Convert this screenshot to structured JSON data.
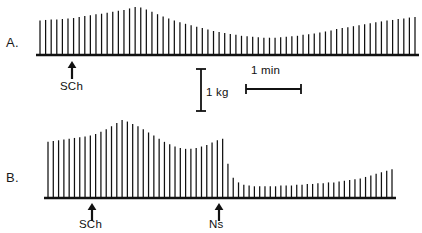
{
  "figure": {
    "background_color": "#ffffff",
    "ink_color": "#111111",
    "width": 422,
    "height": 233
  },
  "panels": [
    {
      "id": "A",
      "label": "A.",
      "label_x": 6,
      "label_y": 35,
      "baseline_y": 55,
      "trace_x_start": 40,
      "trace_x_end": 415,
      "spike_count": 68,
      "annotations": [
        {
          "name": "sch",
          "label": "SCh",
          "arrow_x": 72,
          "label_x": 60,
          "label_y": 84
        }
      ]
    },
    {
      "id": "B",
      "label": "B.",
      "label_x": 6,
      "label_y": 170,
      "baseline_y": 198,
      "trace_x_start": 48,
      "trace_x_end": 392,
      "spike_count": 66,
      "annotations": [
        {
          "name": "sch",
          "label": "SCh",
          "arrow_x": 92,
          "label_x": 80,
          "label_y": 218
        },
        {
          "name": "ns",
          "label": "Ns",
          "arrow_x": 219,
          "label_x": 210,
          "label_y": 218
        }
      ]
    }
  ],
  "calibration": {
    "force": {
      "label": "1 kg",
      "orientation": "vertical",
      "x": 200,
      "y_top": 68,
      "y_bottom": 110,
      "cap_half_width": 5,
      "label_x": 207,
      "label_y": 94
    },
    "time": {
      "label": "1 min",
      "orientation": "horizontal",
      "y": 88,
      "x_left": 246,
      "x_right": 301,
      "cap_half_height": 5,
      "label_x": 253,
      "label_y": 73
    }
  },
  "chart_data": {
    "type": "line",
    "title": "",
    "subtitle": "",
    "xlabel": "",
    "ylabel": "",
    "units": {
      "y": "kg",
      "x": "min"
    },
    "scale_bars": {
      "y": 1,
      "y_unit": "kg",
      "x": 1,
      "x_unit": "min"
    },
    "series": [
      {
        "name": "A",
        "panel": "A",
        "event_markers": [
          {
            "label": "SCh",
            "index": 6
          }
        ],
        "envelope_note": "Baseline twitch height, small augmentation after SCh, peak then progressive depression to a trough near mid-record, followed by slow recovery toward and slightly above control by the end of the trace.",
        "values": [
          0.72,
          0.73,
          0.74,
          0.74,
          0.75,
          0.76,
          0.77,
          0.79,
          0.81,
          0.83,
          0.85,
          0.86,
          0.88,
          0.9,
          0.92,
          0.94,
          0.97,
          1.0,
          0.99,
          0.95,
          0.9,
          0.85,
          0.8,
          0.76,
          0.72,
          0.68,
          0.65,
          0.62,
          0.59,
          0.56,
          0.53,
          0.5,
          0.48,
          0.46,
          0.44,
          0.42,
          0.4,
          0.39,
          0.38,
          0.37,
          0.36,
          0.36,
          0.36,
          0.37,
          0.38,
          0.39,
          0.4,
          0.42,
          0.43,
          0.45,
          0.47,
          0.49,
          0.51,
          0.54,
          0.56,
          0.58,
          0.6,
          0.62,
          0.64,
          0.66,
          0.68,
          0.7,
          0.72,
          0.73,
          0.75,
          0.76,
          0.78,
          0.79
        ]
      },
      {
        "name": "B",
        "panel": "B",
        "event_markers": [
          {
            "label": "SCh",
            "index": 9
          },
          {
            "label": "Ns",
            "index": 33
          }
        ],
        "envelope_note": "Baseline twitch height, marked augmentation after SCh to a high peak, partial decline to a plateau, a secondary rise just before neostigmine, then an abrupt profound depression after Ns with only slight late recovery.",
        "values": [
          0.72,
          0.73,
          0.74,
          0.75,
          0.76,
          0.77,
          0.78,
          0.79,
          0.8,
          0.82,
          0.85,
          0.88,
          0.92,
          0.96,
          1.0,
          0.98,
          0.95,
          0.92,
          0.88,
          0.84,
          0.8,
          0.76,
          0.72,
          0.69,
          0.66,
          0.64,
          0.63,
          0.63,
          0.64,
          0.66,
          0.68,
          0.71,
          0.74,
          0.76,
          0.44,
          0.26,
          0.2,
          0.17,
          0.16,
          0.15,
          0.15,
          0.15,
          0.15,
          0.15,
          0.16,
          0.16,
          0.16,
          0.17,
          0.17,
          0.18,
          0.18,
          0.19,
          0.19,
          0.2,
          0.2,
          0.21,
          0.22,
          0.23,
          0.24,
          0.25,
          0.27,
          0.29,
          0.31,
          0.33,
          0.35,
          0.37
        ]
      }
    ]
  }
}
